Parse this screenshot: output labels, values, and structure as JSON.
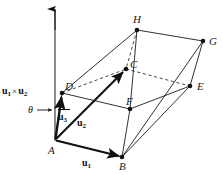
{
  "figure": {
    "background_color": "#ffffff",
    "line_color": "#1a1a1a",
    "vertices": [
      {
        "name": "A",
        "label": "A",
        "x": 55,
        "y": 140,
        "label_x": 48,
        "label_y": 145,
        "dot": false
      },
      {
        "name": "B",
        "label": "B",
        "x": 122,
        "y": 157,
        "label_x": 119,
        "label_y": 161,
        "dot": true
      },
      {
        "name": "C",
        "label": "C",
        "x": 126,
        "y": 69,
        "label_x": 130,
        "label_y": 59,
        "dot": true
      },
      {
        "name": "D",
        "label": "D",
        "x": 62,
        "y": 93,
        "label_x": 65,
        "label_y": 81,
        "dot": true
      },
      {
        "name": "E",
        "label": "E",
        "x": 190,
        "y": 86,
        "label_x": 197,
        "label_y": 81,
        "dot": true
      },
      {
        "name": "F",
        "label": "F",
        "x": 130,
        "y": 109,
        "label_x": 126,
        "label_y": 96,
        "dot": true
      },
      {
        "name": "G",
        "label": "G",
        "x": 203,
        "y": 41,
        "label_x": 209,
        "label_y": 36,
        "dot": true
      },
      {
        "name": "H",
        "label": "H",
        "x": 137,
        "y": 30,
        "label_x": 133,
        "label_y": 14,
        "dot": true
      }
    ],
    "solid_edges": [
      {
        "from": "A",
        "to": "B"
      },
      {
        "from": "A",
        "to": "D"
      },
      {
        "from": "A",
        "to": "F"
      },
      {
        "from": "B",
        "to": "F"
      },
      {
        "from": "B",
        "to": "E"
      },
      {
        "from": "D",
        "to": "H"
      },
      {
        "from": "D",
        "to": "F"
      },
      {
        "from": "F",
        "to": "E"
      },
      {
        "from": "H",
        "to": "G"
      },
      {
        "from": "G",
        "to": "E"
      },
      {
        "from": "H",
        "to": "F"
      },
      {
        "from": "G",
        "to": "B"
      }
    ],
    "dashed_edges": [
      {
        "from": "H",
        "to": "C"
      },
      {
        "from": "C",
        "to": "E"
      },
      {
        "from": "D",
        "to": "C"
      }
    ],
    "vectors": [
      {
        "name": "u1",
        "label": "u",
        "sub": "1",
        "from": "A",
        "to": "B",
        "label_x": 82,
        "label_y": 160
      },
      {
        "name": "u2",
        "label": "u",
        "sub": "2",
        "from": "A",
        "to": "C",
        "label_x": 77,
        "label_y": 120
      },
      {
        "name": "u3",
        "label": "u",
        "sub": "3",
        "from": "A",
        "to": "D",
        "label_x": 58,
        "label_y": 112
      }
    ],
    "axis": {
      "name": "cross-product-axis",
      "x": 55,
      "y_top": 8,
      "y_bottom": 140
    },
    "annotations": {
      "cross_product": {
        "u": "u",
        "sub1": "1",
        "times": "×",
        "sub2": "2",
        "text": "u1 × u2",
        "x": 2,
        "y": 87
      },
      "theta": {
        "symbol": "θ",
        "x": 29,
        "y": 106
      }
    }
  }
}
